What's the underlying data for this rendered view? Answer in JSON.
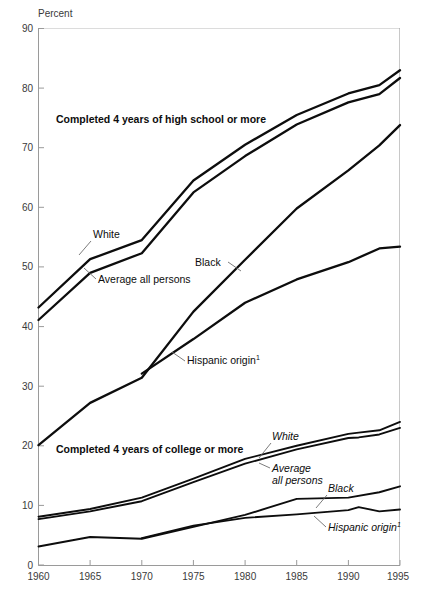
{
  "chart_data": {
    "type": "line",
    "title": "",
    "ylabel": "Percent",
    "xlabel": "",
    "ylim": [
      0,
      90
    ],
    "xlim": [
      1960,
      1995
    ],
    "grid": false,
    "legend_position": "inline-annotations",
    "y_ticks": [
      0,
      10,
      20,
      30,
      40,
      50,
      60,
      70,
      80,
      90
    ],
    "x_ticks": [
      1960,
      1965,
      1970,
      1975,
      1980,
      1985,
      1990,
      1995
    ],
    "panels": [
      {
        "name": "high-school",
        "title": "Completed 4 years of high school or more",
        "series": [
          {
            "name": "White",
            "x": [
              1960,
              1965,
              1970,
              1975,
              1980,
              1985,
              1990,
              1993,
              1995
            ],
            "values": [
              43.2,
              51.3,
              54.5,
              64.5,
              70.5,
              75.5,
              79.1,
              80.5,
              83.0
            ]
          },
          {
            "name": "Average all persons",
            "x": [
              1960,
              1965,
              1970,
              1975,
              1980,
              1985,
              1990,
              1993,
              1995
            ],
            "values": [
              41.1,
              49.0,
              52.3,
              62.5,
              68.6,
              73.9,
              77.6,
              79.0,
              81.7
            ]
          },
          {
            "name": "Black",
            "x": [
              1960,
              1965,
              1970,
              1975,
              1980,
              1985,
              1990,
              1993,
              1995
            ],
            "values": [
              20.1,
              27.2,
              31.4,
              42.5,
              51.2,
              59.8,
              66.2,
              70.4,
              73.8
            ]
          },
          {
            "name": "Hispanic origin",
            "footnote": "1",
            "x": [
              1970,
              1975,
              1980,
              1985,
              1990,
              1993,
              1995
            ],
            "values": [
              32.1,
              37.9,
              44.0,
              47.9,
              50.8,
              53.1,
              53.4
            ]
          }
        ]
      },
      {
        "name": "college",
        "title": "Completed 4 years of college or more",
        "series": [
          {
            "name": "White",
            "x": [
              1960,
              1965,
              1970,
              1975,
              1980,
              1985,
              1990,
              1991,
              1993,
              1995
            ],
            "values": [
              8.1,
              9.4,
              11.3,
              14.5,
              17.8,
              20.0,
              22.0,
              22.2,
              22.6,
              24.0
            ]
          },
          {
            "name": "Average all persons",
            "x": [
              1960,
              1965,
              1970,
              1975,
              1980,
              1985,
              1990,
              1991,
              1993,
              1995
            ],
            "values": [
              7.7,
              9.0,
              10.7,
              13.9,
              17.0,
              19.4,
              21.3,
              21.4,
              21.9,
              23.0
            ]
          },
          {
            "name": "Black",
            "x": [
              1960,
              1965,
              1970,
              1975,
              1980,
              1985,
              1990,
              1993,
              1995
            ],
            "values": [
              3.1,
              4.7,
              4.4,
              6.4,
              8.4,
              11.1,
              11.3,
              12.2,
              13.2
            ]
          },
          {
            "name": "Hispanic origin",
            "footnote": "1",
            "x": [
              1970,
              1975,
              1980,
              1985,
              1990,
              1991,
              1993,
              1995
            ],
            "values": [
              4.5,
              6.6,
              7.9,
              8.5,
              9.2,
              9.7,
              9.0,
              9.3
            ]
          }
        ]
      }
    ],
    "annotations": [
      {
        "name": "hs-panel-title",
        "text": "Completed 4 years of high school or more"
      },
      {
        "name": "hs-white",
        "text": "White"
      },
      {
        "name": "hs-average",
        "text": "Average all persons"
      },
      {
        "name": "hs-black",
        "text": "Black"
      },
      {
        "name": "hs-hispanic",
        "text": "Hispanic origin",
        "sup": "1"
      },
      {
        "name": "col-panel-title",
        "text": "Completed 4 years of college or more"
      },
      {
        "name": "col-white",
        "text": "White"
      },
      {
        "name": "col-average-l1",
        "text": "Average"
      },
      {
        "name": "col-average-l2",
        "text": "all persons"
      },
      {
        "name": "col-black",
        "text": "Black"
      },
      {
        "name": "col-hispanic",
        "text": "Hispanic origin",
        "sup": "1"
      }
    ]
  },
  "axis": {
    "y_title": "Percent",
    "y_tick_labels": [
      "90",
      "80",
      "70",
      "60",
      "50",
      "40",
      "30",
      "20",
      "10",
      "0"
    ],
    "x_tick_labels": [
      "1960",
      "1965",
      "1970",
      "1975",
      "1980",
      "1985",
      "1990",
      "1995"
    ]
  },
  "colors": {
    "line": "#0d0d0d",
    "axis": "#9a9a9a",
    "tick_text": "#3a3a3a",
    "background": "#ffffff",
    "leader": "#6d6d6d"
  },
  "labels": {
    "hs_title": "Completed 4 years of high school or more",
    "col_title": "Completed 4 years of college or more",
    "white": "White",
    "average_all_persons": "Average all persons",
    "average_line1": "Average",
    "average_line2": "all persons",
    "black": "Black",
    "hispanic": "Hispanic origin",
    "footnote_marker": "1"
  }
}
